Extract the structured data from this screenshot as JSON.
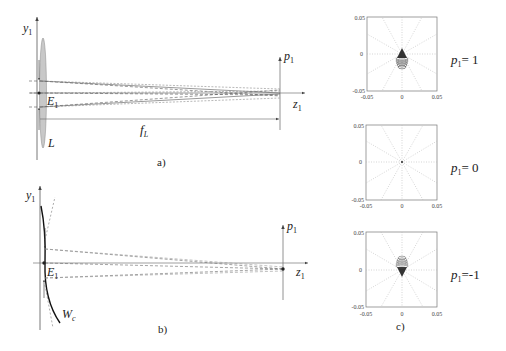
{
  "figure": {
    "panel_a": {
      "caption": "a)",
      "axis_y_label": "y",
      "axis_y_sub": "1",
      "axis_z_label": "z",
      "axis_z_sub": "1",
      "plane_label": "p",
      "plane_sub": "1",
      "point_label": "E",
      "point_sub": "1",
      "lens_label": "L",
      "focal_label": "f",
      "focal_sub": "L"
    },
    "panel_b": {
      "caption": "b)",
      "axis_y_label": "y",
      "axis_y_sub": "1",
      "axis_z_label": "z",
      "axis_z_sub": "1",
      "plane_label": "p",
      "plane_sub": "1",
      "point_label": "E",
      "point_sub": "1",
      "wavefront_label": "W",
      "wavefront_sub": "c"
    },
    "panel_c": {
      "caption": "c)",
      "plots": [
        {
          "label": "p",
          "sub": "1",
          "value": "= 1",
          "x_ticks": [
            "-0.05",
            "0",
            "0.05"
          ],
          "y_ticks": [
            "0.05",
            "0",
            "-0.05"
          ]
        },
        {
          "label": "p",
          "sub": "1",
          "value": "= 0",
          "x_ticks": [
            "-0.05",
            "0",
            "0.05"
          ],
          "y_ticks": [
            "0.05",
            "0",
            "-0.05"
          ]
        },
        {
          "label": "p",
          "sub": "1",
          "value": "=-1",
          "x_ticks": [
            "-0.05",
            "0",
            "0.05"
          ],
          "y_ticks": [
            "0.05",
            "0",
            "-0.05"
          ]
        }
      ]
    },
    "colors": {
      "axis": "#555555",
      "lens_fill": "#c8c8c8",
      "ray": "#555555",
      "grid": "#b0b0b0",
      "spot": "#333333"
    }
  }
}
